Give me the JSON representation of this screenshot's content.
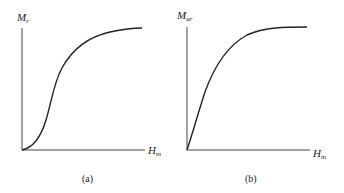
{
  "panels": [
    {
      "id": "a",
      "caption": "(a)",
      "y_label": {
        "main": "M",
        "sub": "r"
      },
      "x_label": {
        "main": "H",
        "sub": "m"
      },
      "curve_shape": "sigmoid (S-shaped), starts at origin, slow rise, steep middle, saturates"
    },
    {
      "id": "b",
      "caption": "(b)",
      "y_label": {
        "main": "M",
        "sub": "ar"
      },
      "x_label": {
        "main": "H",
        "sub": "m"
      },
      "curve_shape": "steep near-linear rise from origin, then saturating plateau"
    }
  ],
  "colors": {
    "line": "#222222",
    "axis": "#444444",
    "background": "#ffffff"
  }
}
